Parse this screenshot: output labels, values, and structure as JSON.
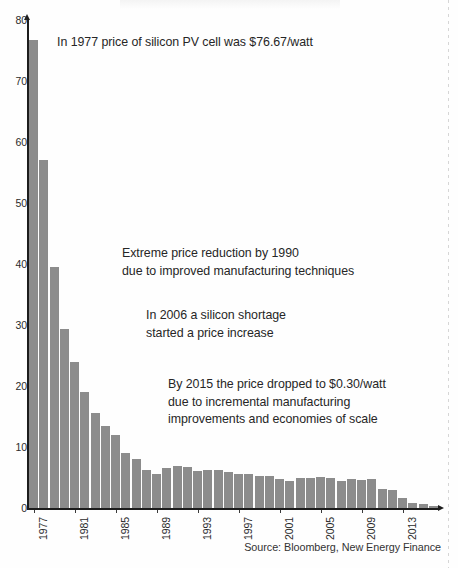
{
  "chart_data": {
    "type": "bar",
    "title": "",
    "subtitle": "",
    "xlabel": "",
    "ylabel": "",
    "ylim": [
      0,
      80
    ],
    "yticks": [
      0,
      10,
      20,
      30,
      40,
      50,
      60,
      70,
      80
    ],
    "ytick_labels": [
      "0",
      "10",
      "20",
      "30",
      "40",
      "50",
      "60",
      "70",
      "80"
    ],
    "grid": false,
    "legend": null,
    "bar_color": "#8c8c8c",
    "axis_color": "#1d1d1d",
    "units": "USD per watt",
    "xtick_labels": [
      "1977",
      "1981",
      "1985",
      "1989",
      "1993",
      "1997",
      "2001",
      "2005",
      "2009",
      "2013"
    ],
    "categories": [
      "1977",
      "1978",
      "1979",
      "1980",
      "1981",
      "1982",
      "1983",
      "1984",
      "1985",
      "1986",
      "1987",
      "1988",
      "1989",
      "1990",
      "1991",
      "1992",
      "1993",
      "1994",
      "1995",
      "1996",
      "1997",
      "1998",
      "1999",
      "2000",
      "2001",
      "2002",
      "2003",
      "2004",
      "2005",
      "2006",
      "2007",
      "2008",
      "2009",
      "2010",
      "2011",
      "2012",
      "2013",
      "2014",
      "2015",
      "2016"
    ],
    "values": [
      76.67,
      57.0,
      39.5,
      29.4,
      24.0,
      19.0,
      15.5,
      13.5,
      12.0,
      9.1,
      8.0,
      6.2,
      5.6,
      6.5,
      6.9,
      6.7,
      6.1,
      6.2,
      6.3,
      5.9,
      5.6,
      5.6,
      5.3,
      5.3,
      4.7,
      4.5,
      4.9,
      5.0,
      5.1,
      5.0,
      4.5,
      4.7,
      4.6,
      4.7,
      3.1,
      2.9,
      1.6,
      0.9,
      0.6,
      0.35
    ],
    "annotations": [
      {
        "id": "anno-1977",
        "text": "In 1977 price of silicon PV cell was $76.67/watt",
        "anchor_year": "1977",
        "anchor_value": 76.67
      },
      {
        "id": "anno-1990",
        "text": "Extreme price reduction by 1990\ndue to improved manufacturing techniques",
        "anchor_year": "1990"
      },
      {
        "id": "anno-2006",
        "text": "In 2006 a silicon shortage\nstarted a price increase",
        "anchor_year": "2006"
      },
      {
        "id": "anno-2015",
        "text": "By 2015 the price dropped to $0.30/watt\ndue to incremental manufacturing\nimprovements and economies of scale",
        "anchor_year": "2015",
        "anchor_value": 0.3
      }
    ],
    "source": "Source: Bloomberg, New Energy Finance"
  }
}
